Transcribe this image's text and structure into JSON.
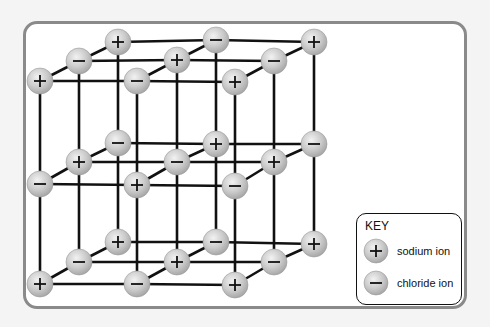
{
  "diagram": {
    "type": "sodium chloride crystal lattice",
    "colors": {
      "ion_fill": "#c8c8c8",
      "ion_highlight": "#eeeeee",
      "bond": "#111111",
      "frame": "#8a8a8a"
    },
    "layers": [
      {
        "name": "top",
        "rows": [
          [
            {
              "x": 118,
              "y": 42,
              "charge": "+"
            },
            {
              "x": 216,
              "y": 40,
              "charge": "−"
            },
            {
              "x": 314,
              "y": 42,
              "charge": "+"
            }
          ],
          [
            {
              "x": 79,
              "y": 61,
              "charge": "−"
            },
            {
              "x": 177,
              "y": 60,
              "charge": "+"
            },
            {
              "x": 274,
              "y": 61,
              "charge": "−"
            }
          ],
          [
            {
              "x": 40,
              "y": 81,
              "charge": "+"
            },
            {
              "x": 137,
              "y": 81,
              "charge": "−"
            },
            {
              "x": 235,
              "y": 82,
              "charge": "+"
            }
          ]
        ]
      },
      {
        "name": "middle",
        "rows": [
          [
            {
              "x": 118,
              "y": 143,
              "charge": "−"
            },
            {
              "x": 216,
              "y": 144,
              "charge": "+"
            },
            {
              "x": 314,
              "y": 144,
              "charge": "−"
            }
          ],
          [
            {
              "x": 79,
              "y": 162,
              "charge": "+"
            },
            {
              "x": 177,
              "y": 162,
              "charge": "−"
            },
            {
              "x": 274,
              "y": 162,
              "charge": "+"
            }
          ],
          [
            {
              "x": 40,
              "y": 184,
              "charge": "−"
            },
            {
              "x": 137,
              "y": 185,
              "charge": "+"
            },
            {
              "x": 235,
              "y": 186,
              "charge": "−"
            }
          ]
        ]
      },
      {
        "name": "bottom",
        "rows": [
          [
            {
              "x": 118,
              "y": 242,
              "charge": "+"
            },
            {
              "x": 216,
              "y": 242,
              "charge": "−"
            },
            {
              "x": 314,
              "y": 244,
              "charge": "+"
            }
          ],
          [
            {
              "x": 79,
              "y": 262,
              "charge": "−"
            },
            {
              "x": 177,
              "y": 262,
              "charge": "+"
            },
            {
              "x": 274,
              "y": 262,
              "charge": "−"
            }
          ],
          [
            {
              "x": 40,
              "y": 284,
              "charge": "+"
            },
            {
              "x": 137,
              "y": 284,
              "charge": "−"
            },
            {
              "x": 235,
              "y": 285,
              "charge": "+"
            }
          ]
        ]
      }
    ]
  },
  "key": {
    "title": "KEY",
    "items": [
      {
        "symbol": "+",
        "label": "sodium ion"
      },
      {
        "symbol": "−",
        "label": "chloride ion"
      }
    ]
  }
}
